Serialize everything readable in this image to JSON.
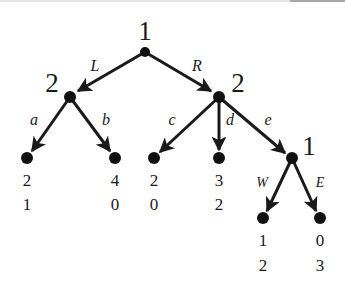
{
  "diagram": {
    "type": "extensive-form game tree",
    "nodes": {
      "root": {
        "player": "1",
        "x": 145,
        "y": 52
      },
      "left": {
        "player": "2",
        "x": 70,
        "y": 97
      },
      "right": {
        "player": "2",
        "x": 219,
        "y": 97
      },
      "sub": {
        "player": "1",
        "x": 292,
        "y": 158
      }
    },
    "actions": {
      "L": "L",
      "R": "R",
      "a": "a",
      "b": "b",
      "c": "c",
      "d": "d",
      "e": "e",
      "W": "W",
      "E": "E"
    },
    "leaves": [
      {
        "action": "a",
        "payoff1": "2",
        "payoff2": "1",
        "x": 27,
        "y": 158
      },
      {
        "action": "b",
        "payoff1": "4",
        "payoff2": "0",
        "x": 115,
        "y": 158
      },
      {
        "action": "c",
        "payoff1": "2",
        "payoff2": "0",
        "x": 154,
        "y": 158
      },
      {
        "action": "d",
        "payoff1": "3",
        "payoff2": "2",
        "x": 219,
        "y": 158
      },
      {
        "action": "W",
        "payoff1": "1",
        "payoff2": "2",
        "x": 263,
        "y": 218
      },
      {
        "action": "E",
        "payoff1": "0",
        "payoff2": "3",
        "x": 320,
        "y": 218
      }
    ],
    "colors": {
      "ink": "#1a1a1a",
      "background": "#ffffff"
    }
  }
}
